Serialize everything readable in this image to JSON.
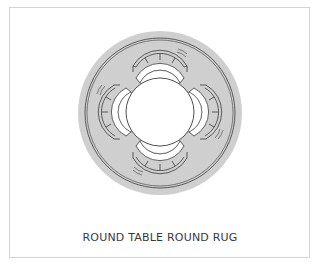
{
  "caption": "ROUND TABLE ROUND RUG",
  "colors": {
    "rug_fill": "#cfcfcf",
    "line": "#3a3a3a",
    "table_fill": "#ffffff",
    "frame_border": "#d4d4d4",
    "background": "#ffffff"
  },
  "diagram": {
    "type": "floor-plan",
    "rug": {
      "shape": "circle",
      "cx": 160,
      "cy": 113,
      "r": 82,
      "inner_ring_inset": 7
    },
    "table": {
      "shape": "circle",
      "cx": 160,
      "cy": 112,
      "r": 34
    },
    "chairs": [
      {
        "position": "top",
        "angle": 0
      },
      {
        "position": "right",
        "angle": 90
      },
      {
        "position": "bottom",
        "angle": 180
      },
      {
        "position": "left",
        "angle": 270
      }
    ]
  }
}
